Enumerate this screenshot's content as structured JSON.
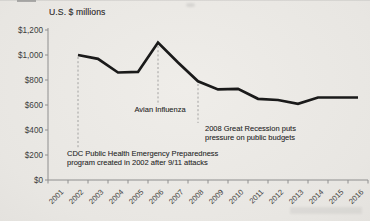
{
  "chart_data": {
    "type": "line",
    "title": "U.S. $ millions",
    "categories": [
      "2001",
      "2002",
      "2003",
      "2004",
      "2005",
      "2006",
      "2007",
      "2008",
      "2009",
      "2010",
      "2011",
      "2012",
      "2013",
      "2014",
      "2015",
      "2016"
    ],
    "values": [
      null,
      1000,
      970,
      860,
      865,
      1100,
      940,
      790,
      725,
      730,
      650,
      640,
      610,
      660,
      660,
      660
    ],
    "ylim": [
      0,
      1200
    ],
    "y_tick_step": 200,
    "y_tick_labels": [
      "$1,200",
      "$1,000",
      "$800",
      "$600",
      "$400",
      "$200",
      "$0"
    ],
    "grid": false,
    "legend": "none",
    "line_color": "#1a1a1a",
    "axis_color": "#8e8e8e",
    "text_color": "#3c3c3c",
    "annotations": [
      {
        "id": "avian",
        "year": "2006",
        "lines": [
          "Avian Influenza"
        ]
      },
      {
        "id": "recession",
        "year": "2008",
        "lines": [
          "2008 Great Recession puts",
          "pressure on public budgets"
        ]
      },
      {
        "id": "cdc",
        "year": "2002",
        "lines": [
          "CDC Public Health Emergency Preparedness",
          "program created in 2002 after 9/11 attacks"
        ]
      }
    ]
  }
}
